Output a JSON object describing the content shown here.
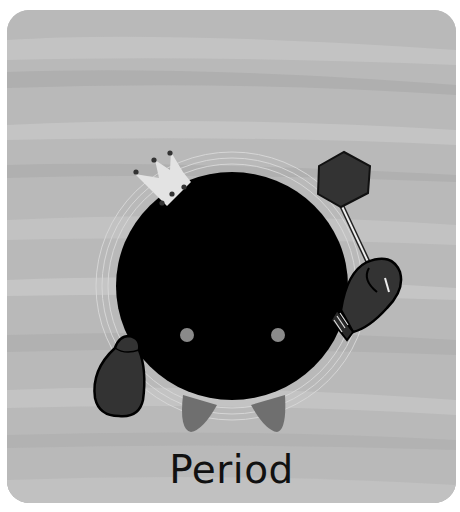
{
  "card": {
    "caption": "Period",
    "background_color": "#b9b9b9",
    "character": {
      "name": "period-character",
      "body_color": "#000000",
      "eye_color": "#8a8a8a",
      "feet_color": "#6f6f6f",
      "glove_color": "#333333",
      "accessories": [
        "crown-icon",
        "stop-sign-icon",
        "boxing-glove-icon"
      ]
    }
  }
}
